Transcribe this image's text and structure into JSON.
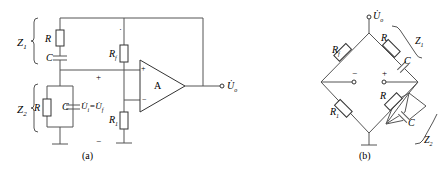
{
  "figure_a": {
    "caption": "(a)",
    "labels": {
      "z1": "Z",
      "z1_sub": "1",
      "z2": "Z",
      "z2_sub": "2",
      "r_top": "R",
      "c_top": "C",
      "r_bottom": "R",
      "c_bottom": "C",
      "rf": "R",
      "rf_sub": "f",
      "r1": "R",
      "r1_sub": "1",
      "voltage_eq": "U̇",
      "voltage_eq_sub": "i",
      "voltage_eq_eq": "=U̇",
      "voltage_eq_sub2": "f",
      "plus": "+",
      "minus": "−",
      "dot": "·",
      "opamp": "A",
      "opamp_plus": "+",
      "opamp_minus": "−",
      "output": "U̇",
      "output_sub": "o"
    }
  },
  "figure_b": {
    "caption": "(b)",
    "labels": {
      "output": "U̇",
      "output_sub": "o",
      "rf": "R",
      "rf_sub": "f",
      "r1": "R",
      "r1_sub": "1",
      "r_top": "R",
      "c_top": "C",
      "r_bottom": "R",
      "c_bottom": "C",
      "z1": "Z",
      "z1_sub": "1",
      "z2": "Z",
      "z2_sub": "2",
      "plus": "+",
      "minus": "−"
    }
  }
}
